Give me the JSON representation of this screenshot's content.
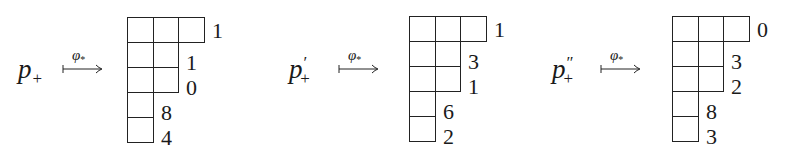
{
  "map_label": {
    "symbol": "φ",
    "subscript": "*"
  },
  "panels": [
    {
      "source": {
        "base": "p",
        "primes": "",
        "subscript": "+"
      },
      "rows": [
        3,
        2,
        2,
        1,
        1
      ],
      "row_labels": [
        "1",
        "1",
        "0",
        "8",
        "4"
      ]
    },
    {
      "source": {
        "base": "p",
        "primes": "′",
        "subscript": "+"
      },
      "rows": [
        3,
        2,
        2,
        1,
        1
      ],
      "row_labels": [
        "1",
        "3",
        "1",
        "6",
        "2"
      ]
    },
    {
      "source": {
        "base": "p",
        "primes": "″",
        "subscript": "+"
      },
      "rows": [
        3,
        2,
        2,
        1,
        1
      ],
      "row_labels": [
        "0",
        "3",
        "2",
        "8",
        "3"
      ]
    }
  ]
}
